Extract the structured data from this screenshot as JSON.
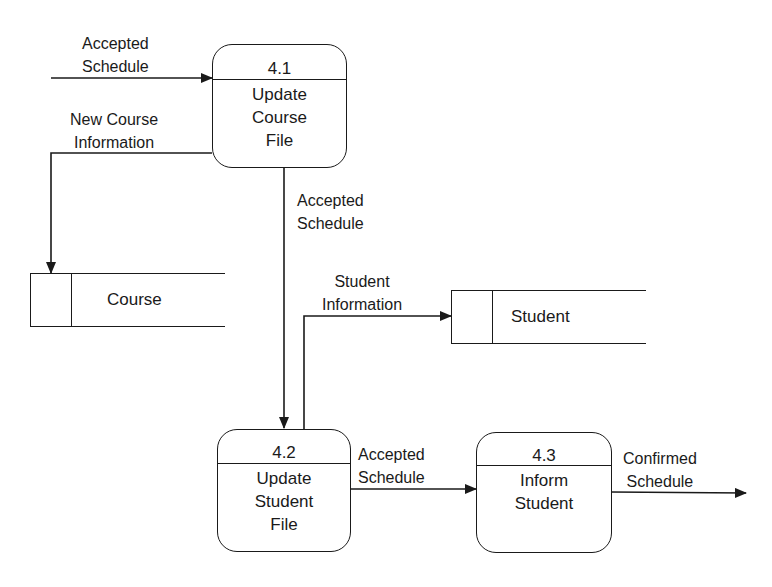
{
  "processes": [
    {
      "id": "4.1",
      "name_lines": [
        "Update",
        "Course",
        "File"
      ]
    },
    {
      "id": "4.2",
      "name_lines": [
        "Update",
        "Student",
        "File"
      ]
    },
    {
      "id": "4.3",
      "name_lines": [
        "Inform",
        "Student"
      ]
    }
  ],
  "data_stores": [
    {
      "name": "Course"
    },
    {
      "name": "Student"
    }
  ],
  "flows": [
    {
      "label_lines": [
        "Accepted",
        "Schedule"
      ],
      "from": "external",
      "to": "4.1"
    },
    {
      "label_lines": [
        "New Course",
        "Information"
      ],
      "from": "4.1",
      "to": "Course"
    },
    {
      "label_lines": [
        "Accepted",
        "Schedule"
      ],
      "from": "4.1",
      "to": "4.2"
    },
    {
      "label_lines": [
        "Student",
        "Information"
      ],
      "from": "4.2",
      "to": "Student"
    },
    {
      "label_lines": [
        "Accepted",
        "Schedule"
      ],
      "from": "4.2",
      "to": "4.3"
    },
    {
      "label_lines": [
        "Confirmed",
        "Schedule"
      ],
      "from": "4.3",
      "to": "external"
    }
  ],
  "colors": {
    "line": "#1a1a1a",
    "background": "#ffffff"
  }
}
